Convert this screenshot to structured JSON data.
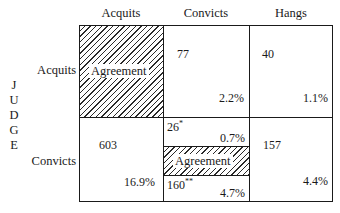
{
  "columns": {
    "c1": "Acquits",
    "c2": "Convicts",
    "c3": "Hangs"
  },
  "rows": {
    "r1": "Acquits",
    "r2": "Convicts"
  },
  "side_label": [
    "J",
    "U",
    "D",
    "G",
    "E"
  ],
  "cells": {
    "acquits_acquits": {
      "label": "Agreement"
    },
    "acquits_convicts": {
      "count": "77",
      "pct": "2.2%"
    },
    "acquits_hangs": {
      "count": "40",
      "pct": "1.1%"
    },
    "convicts_acquits": {
      "count": "603",
      "pct": "16.9%"
    },
    "convicts_convicts": {
      "top": {
        "count": "26",
        "mark": "*",
        "pct": "0.7%"
      },
      "middle": {
        "label": "Agreement"
      },
      "bottom": {
        "count": "160",
        "mark": "**",
        "pct": "4.7%"
      }
    },
    "convicts_hangs": {
      "count": "157",
      "pct": "4.4%"
    }
  }
}
